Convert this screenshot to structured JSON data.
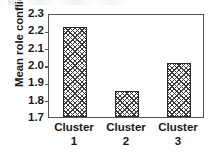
{
  "chart_data": {
    "type": "bar",
    "title": "",
    "subtitle": "",
    "xlabel": "",
    "ylabel": "Mean role conflict",
    "categories": [
      "Cluster 1",
      "Cluster 2",
      "Cluster 3"
    ],
    "category_lines": [
      [
        "Cluster",
        "1"
      ],
      [
        "Cluster",
        "2"
      ],
      [
        "Cluster",
        "3"
      ]
    ],
    "values": [
      2.22,
      1.85,
      2.01
    ],
    "ylim": [
      1.7,
      2.3
    ],
    "ytick_step": 0.1,
    "yticks": [
      "2.3",
      "2.2",
      "2.1",
      "2.0",
      "1.9",
      "1.8",
      "1.7"
    ],
    "ytick_values": [
      2.3,
      2.2,
      2.1,
      2.0,
      1.9,
      1.8,
      1.7
    ],
    "grid": false,
    "legend": false,
    "legend_position": "none",
    "bar_fill": "cross-hatch",
    "colors": {
      "bar_outline": "#2a2a2a",
      "bar_hatch": "#3a3a3a",
      "frame": "#55575a",
      "text": "#1a1a1a",
      "background": "#ffffff"
    }
  }
}
